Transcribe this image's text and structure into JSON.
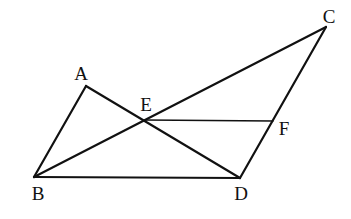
{
  "diagram": {
    "type": "geometry",
    "points": {
      "A": {
        "label": "A",
        "x": 86,
        "y": 86,
        "lx": 81,
        "ly": 80
      },
      "B": {
        "label": "B",
        "x": 34,
        "y": 177,
        "lx": 38,
        "ly": 200
      },
      "C": {
        "label": "C",
        "x": 326,
        "y": 27,
        "lx": 329,
        "ly": 23
      },
      "D": {
        "label": "D",
        "x": 240,
        "y": 178,
        "lx": 241,
        "ly": 200
      },
      "E": {
        "label": "E",
        "x": 145,
        "y": 120,
        "lx": 146,
        "ly": 111
      },
      "F": {
        "label": "F",
        "x": 273,
        "y": 121,
        "lx": 284,
        "ly": 135
      }
    },
    "segments": [
      {
        "from": "A",
        "to": "B",
        "style": "thick"
      },
      {
        "from": "A",
        "to": "D",
        "style": "thick"
      },
      {
        "from": "B",
        "to": "C",
        "style": "thick"
      },
      {
        "from": "B",
        "to": "D",
        "style": "thick"
      },
      {
        "from": "C",
        "to": "D",
        "style": "thick"
      },
      {
        "from": "E",
        "to": "F",
        "style": "thin"
      }
    ],
    "relations": [
      "E is the intersection of AD and BC",
      "F lies on CD",
      "EF is parallel to BD"
    ],
    "colors": {
      "stroke": "#111111",
      "background": "#ffffff"
    }
  }
}
